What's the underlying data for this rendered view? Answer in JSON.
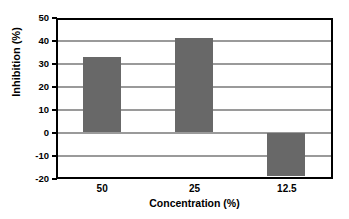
{
  "chart_data": {
    "type": "bar",
    "title": "",
    "subtitle": "",
    "categories": [
      "50",
      "25",
      "12.5"
    ],
    "values": [
      33,
      41,
      -19
    ],
    "xlabel": "Concentration (%)",
    "ylabel": "Inhibition (%)",
    "ylim": [
      -20,
      50
    ],
    "ytick_step": 10,
    "yticks": [
      "50",
      "40",
      "30",
      "20",
      "10",
      "0",
      "-10",
      "-20"
    ],
    "ytick_values": [
      50,
      40,
      30,
      20,
      10,
      0,
      -10,
      -20
    ],
    "grid": true,
    "grid_axis": "y",
    "legend": false,
    "legend_position": "none",
    "series": [
      {
        "name": "Inhibition",
        "values": [
          33,
          41,
          -19
        ]
      }
    ],
    "colors": {
      "bar": "#686868",
      "axis": "#000000",
      "gridline": "#9a9a9a",
      "background": "#ffffff",
      "text": "#000000"
    }
  }
}
